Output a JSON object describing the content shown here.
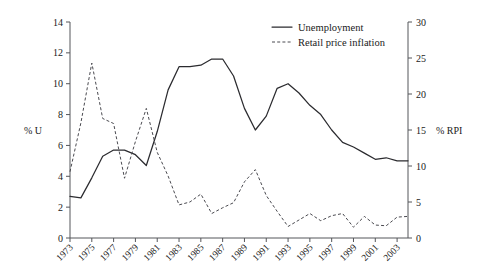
{
  "chart_data": {
    "type": "line",
    "title": "",
    "xlabel": "",
    "ylabel": "% U",
    "ylabel_right": "% RPI",
    "grid": false,
    "legend_position": "top-right",
    "x": [
      1973,
      1974,
      1975,
      1976,
      1977,
      1978,
      1979,
      1980,
      1981,
      1982,
      1983,
      1984,
      1985,
      1986,
      1987,
      1988,
      1989,
      1990,
      1991,
      1992,
      1993,
      1994,
      1995,
      1996,
      1997,
      1998,
      1999,
      2000,
      2001,
      2002,
      2003,
      2004
    ],
    "xlim": [
      1973,
      2004
    ],
    "xticks": [
      1973,
      1975,
      1977,
      1979,
      1981,
      1983,
      1985,
      1987,
      1989,
      1991,
      1993,
      1995,
      1997,
      1999,
      2001,
      2003
    ],
    "xticklabels": [
      "1973",
      "1975",
      "1977",
      "1979",
      "1981",
      "1983",
      "1985",
      "1987",
      "1989",
      "1991",
      "1993",
      "1995",
      "1997",
      "1999",
      "2001",
      "2003"
    ],
    "ylim": [
      0,
      14
    ],
    "yticks": [
      0,
      2,
      4,
      6,
      8,
      10,
      12,
      14
    ],
    "yticklabels": [
      "0",
      "2",
      "4",
      "6",
      "8",
      "10",
      "12",
      "14"
    ],
    "ylim_right": [
      0,
      30
    ],
    "yticks_right": [
      0,
      5,
      10,
      15,
      20,
      25,
      30
    ],
    "yticklabels_right": [
      "0",
      "5",
      "10",
      "15",
      "20",
      "25",
      "30"
    ],
    "series": [
      {
        "name": "Unemployment",
        "axis": "left",
        "style": "solid",
        "units": "% U",
        "values": [
          2.7,
          2.6,
          3.9,
          5.3,
          5.7,
          5.7,
          5.4,
          4.7,
          6.9,
          9.6,
          11.1,
          11.1,
          11.2,
          11.6,
          11.6,
          10.5,
          8.4,
          7.0,
          7.9,
          9.7,
          10.0,
          9.4,
          8.6,
          8.0,
          7.0,
          6.2,
          5.9,
          5.5,
          5.1,
          5.2,
          5.0,
          5.0
        ]
      },
      {
        "name": "Retail price inflation",
        "axis": "right",
        "style": "dashed",
        "units": "% RPI",
        "values": [
          9.2,
          16.0,
          24.3,
          16.6,
          15.9,
          8.3,
          13.4,
          18.0,
          11.9,
          8.6,
          4.6,
          5.0,
          6.1,
          3.4,
          4.2,
          4.9,
          7.8,
          9.5,
          5.9,
          3.7,
          1.6,
          2.5,
          3.4,
          2.4,
          3.1,
          3.4,
          1.5,
          3.0,
          1.8,
          1.7,
          2.9,
          3.0
        ]
      }
    ],
    "legend": [
      {
        "label": "Unemployment",
        "style": "solid"
      },
      {
        "label": "Retail price inflation",
        "style": "dashed"
      }
    ]
  }
}
